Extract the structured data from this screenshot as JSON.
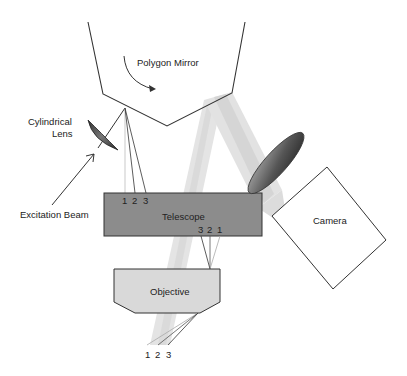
{
  "diagram": {
    "labels": {
      "polygon_mirror": "Polygon Mirror",
      "cylindrical_lens_line1": "Cylindrical",
      "cylindrical_lens_line2": "Lens",
      "excitation_beam": "Excitation Beam",
      "telescope": "Telescope",
      "objective": "Objective",
      "camera": "Camera"
    },
    "telescope_input_numbers": [
      "1",
      "2",
      "3"
    ],
    "telescope_output_numbers": [
      "3",
      "2",
      "1"
    ],
    "sample_numbers": [
      "1",
      "2",
      "3"
    ],
    "colors": {
      "outline": "#333333",
      "telescope_fill": "#8c8c8c",
      "objective_fill": "#d9d9d9",
      "beam_light": "#e6e6e6",
      "beam_mid": "#d0d0d0",
      "lens_dark": "#3a3a3a",
      "lens_light": "#9a9a9a"
    }
  }
}
